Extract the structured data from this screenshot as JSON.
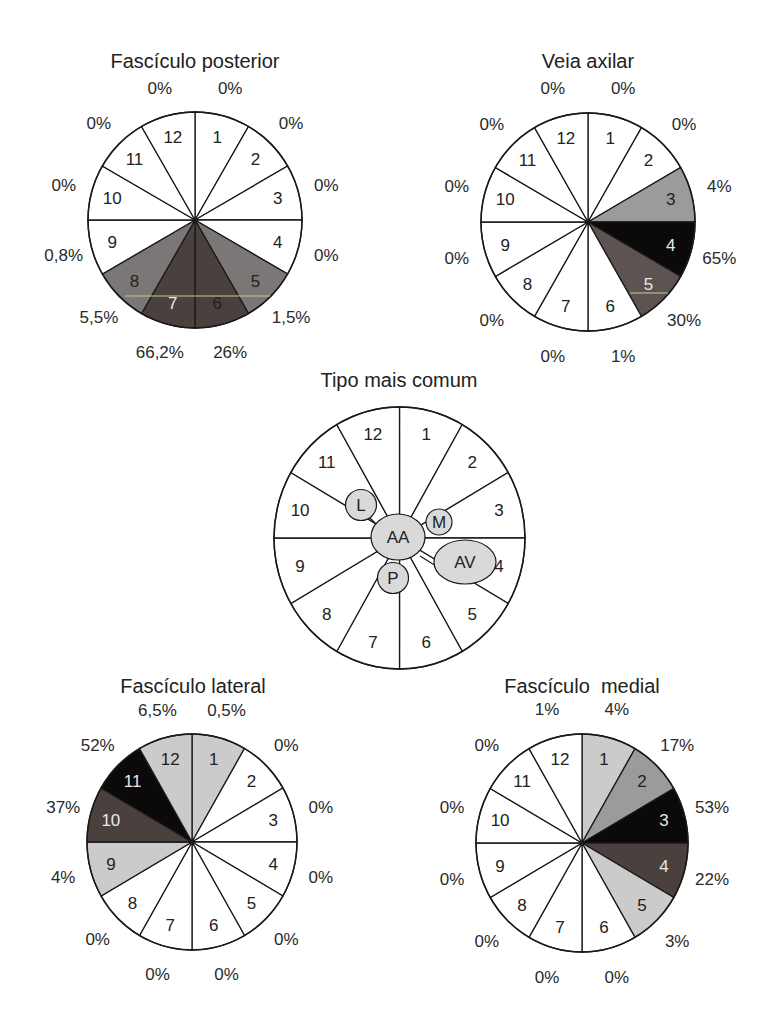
{
  "colors": {
    "white": "#ffffff",
    "light_gray": "#cbcbcb",
    "mid_gray": "#9c9b9b",
    "gray": "#7b7776",
    "dark_brown": "#4a403d",
    "black": "#0b0909",
    "stroke": "#1a1a1a",
    "bubble": "#d9d9d9"
  },
  "chart_data": [
    {
      "type": "pie",
      "id": "fasciculo-posterior",
      "title": "Fascículo posterior",
      "sectors": [
        "1",
        "2",
        "3",
        "4",
        "5",
        "6",
        "7",
        "8",
        "9",
        "10",
        "11",
        "12"
      ],
      "values": [
        "0%",
        "0%",
        "0%",
        "0%",
        "1,5%",
        "26%",
        "66,2%",
        "5,5%",
        "0,8%",
        "0%",
        "0%",
        "0%"
      ],
      "fills": [
        "white",
        "white",
        "white",
        "white",
        "gray",
        "dark_brown",
        "dark_brown",
        "gray",
        "white",
        "white",
        "white",
        "white"
      ],
      "num_light": [
        false,
        false,
        false,
        false,
        false,
        false,
        true,
        false,
        false,
        false,
        false,
        false
      ]
    },
    {
      "type": "pie",
      "id": "veia-axilar",
      "title": "Veia axilar",
      "sectors": [
        "1",
        "2",
        "3",
        "4",
        "5",
        "6",
        "7",
        "8",
        "9",
        "10",
        "11",
        "12"
      ],
      "values": [
        "0%",
        "0%",
        "4%",
        "65%",
        "30%",
        "1%",
        "0%",
        "0%",
        "0%",
        "0%",
        "0%",
        "0%"
      ],
      "fills": [
        "white",
        "white",
        "mid_gray",
        "black",
        "gray_dark",
        "white",
        "white",
        "white",
        "white",
        "white",
        "white",
        "white"
      ],
      "num_light": [
        false,
        false,
        false,
        true,
        true,
        false,
        false,
        false,
        false,
        false,
        false,
        false
      ]
    },
    {
      "type": "diagram",
      "id": "tipo-mais-comum",
      "title": "Tipo mais comum",
      "sectors": [
        "1",
        "2",
        "3",
        "4",
        "5",
        "6",
        "7",
        "8",
        "9",
        "10",
        "11",
        "12"
      ],
      "bubbles": [
        {
          "label": "AA",
          "meaning": "center"
        },
        {
          "label": "L",
          "position": "between 10 and 11"
        },
        {
          "label": "M",
          "position": "between 2 and 3"
        },
        {
          "label": "AV",
          "position": "sector 4"
        },
        {
          "label": "P",
          "position": "between 6 and 7"
        }
      ]
    },
    {
      "type": "pie",
      "id": "fasciculo-lateral",
      "title": "Fascículo lateral",
      "sectors": [
        "1",
        "2",
        "3",
        "4",
        "5",
        "6",
        "7",
        "8",
        "9",
        "10",
        "11",
        "12"
      ],
      "values": [
        "0,5%",
        "0%",
        "0%",
        "0%",
        "0%",
        "0%",
        "0%",
        "0%",
        "4%",
        "37%",
        "52%",
        "6,5%"
      ],
      "fills": [
        "light_gray",
        "white",
        "white",
        "white",
        "white",
        "white",
        "white",
        "white",
        "light_gray",
        "dark_brown",
        "black",
        "light_gray"
      ],
      "num_light": [
        false,
        false,
        false,
        false,
        false,
        false,
        false,
        false,
        false,
        true,
        true,
        false
      ]
    },
    {
      "type": "pie",
      "id": "fasciculo-medial",
      "title": "Fascículo  medial",
      "sectors": [
        "1",
        "2",
        "3",
        "4",
        "5",
        "6",
        "7",
        "8",
        "9",
        "10",
        "11",
        "12"
      ],
      "values": [
        "4%",
        "17%",
        "53%",
        "22%",
        "3%",
        "0%",
        "0%",
        "0%",
        "0%",
        "0%",
        "0%",
        "1%"
      ],
      "fills": [
        "light_gray",
        "mid_gray",
        "black",
        "dark_brown",
        "light_gray",
        "white",
        "white",
        "white",
        "white",
        "white",
        "white",
        "white"
      ],
      "num_light": [
        false,
        false,
        true,
        true,
        false,
        false,
        false,
        false,
        false,
        false,
        false,
        false
      ]
    }
  ]
}
